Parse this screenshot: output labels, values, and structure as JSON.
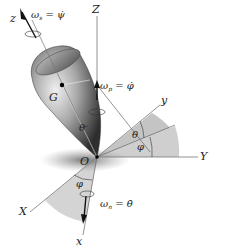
{
  "diagram": {
    "axes": {
      "fixed": {
        "X": "X",
        "Y": "Y",
        "Z": "Z"
      },
      "body": {
        "x": "x",
        "y": "y",
        "z": "z"
      }
    },
    "points": {
      "origin": "O",
      "center_of_mass": "G"
    },
    "angles": {
      "theta": "θ",
      "phi": "φ"
    },
    "angular_velocities": {
      "spin": {
        "symbol": "ω",
        "sub": "s",
        "equals": "=",
        "rate": "ψ̇"
      },
      "precession": {
        "symbol": "ω",
        "sub": "p",
        "equals": "=",
        "rate": "φ̇"
      },
      "nutation": {
        "symbol": "ω",
        "sub": "n",
        "equals": "=",
        "rate": "θ̇"
      }
    },
    "colors": {
      "axis": "#555555",
      "body_dark": "#3a3a3a",
      "body_light": "#d8d8d8",
      "shade": "#c8c8c8",
      "arrow": "#111111"
    }
  }
}
